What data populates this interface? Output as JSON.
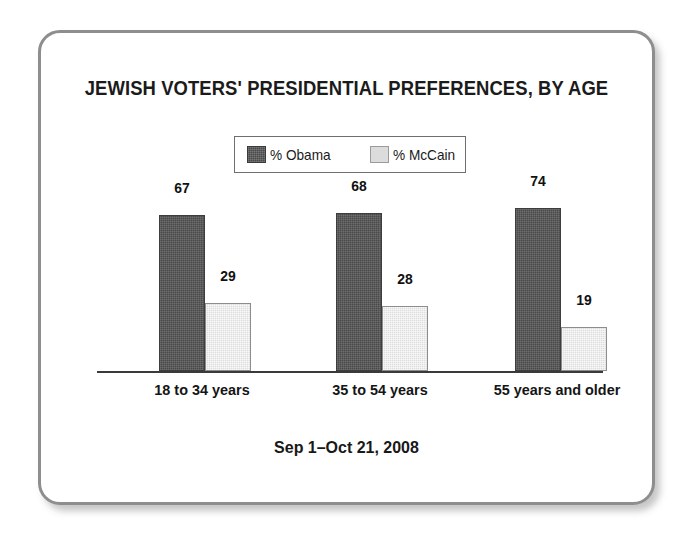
{
  "chart_data": {
    "type": "bar",
    "title": "JEWISH VOTERS' PRESIDENTIAL PREFERENCES, BY AGE",
    "subtitle": "Sep 1–Oct 21, 2008",
    "categories": [
      "18 to 34 years",
      "35 to 54 years",
      "55 years and older"
    ],
    "series": [
      {
        "name": "% Obama",
        "values": [
          67,
          68,
          74
        ],
        "color": "#4a4a4a"
      },
      {
        "name": "% McCain",
        "values": [
          29,
          28,
          19
        ],
        "color": "#dedede"
      }
    ],
    "xlabel": "",
    "ylabel": "",
    "ylim": [
      0,
      100
    ],
    "grid": false,
    "legend_position": "top-center",
    "axis_visible": {
      "x": true,
      "y": false
    }
  },
  "legend": {
    "items": [
      {
        "label": "% Obama",
        "swatch": "dark-gray-swatch"
      },
      {
        "label": "% McCain",
        "swatch": "light-gray-swatch"
      }
    ]
  },
  "frame": {
    "border_color": "#8e8e8e",
    "background": "#ffffff"
  }
}
